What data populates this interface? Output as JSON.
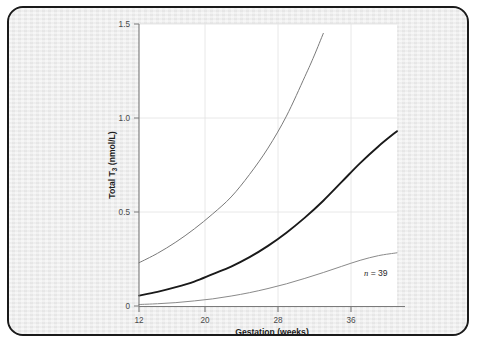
{
  "figure": {
    "frame_border_color": "#1a1a1a",
    "page_background": "#ececec",
    "plot_background": "#ffffff"
  },
  "chart_data": {
    "type": "line",
    "title": "",
    "subtitle": "",
    "xlabel": "Gestation (weeks)",
    "ylabel": "Total T",
    "ylabel_subscript": "3",
    "ylabel_units": " (nmol/L)",
    "ylabel_full": "Total T3 (nmol/L)",
    "xlim": [
      12,
      40
    ],
    "ylim": [
      0,
      1.5
    ],
    "xticks": [
      12,
      20,
      28,
      36
    ],
    "xtick_labels": [
      "12",
      "20",
      "28",
      "36"
    ],
    "yticks": [
      0,
      0.5,
      1.0,
      1.5
    ],
    "ytick_labels": [
      "0",
      "0.5",
      "1.0",
      "1.5"
    ],
    "grid": true,
    "grid_color": "#e2e2e2",
    "legend": "none",
    "annotations": [
      {
        "name": "sample-size",
        "italic_text": "n",
        "text": " = 39",
        "x": 36.0,
        "y": 0.175
      }
    ],
    "series": [
      {
        "name": "Upper reference limit (97.5th centile)",
        "color": "#7a7a7a",
        "width": 1.0,
        "x": [
          12,
          14,
          16,
          18,
          20,
          22,
          24,
          26,
          28,
          30,
          31,
          32
        ],
        "values": [
          0.23,
          0.28,
          0.34,
          0.41,
          0.49,
          0.58,
          0.7,
          0.84,
          1.01,
          1.22,
          1.33,
          1.45
        ]
      },
      {
        "name": "Median (50th centile)",
        "color": "#1a1a1a",
        "width": 1.9,
        "x": [
          12,
          14,
          16,
          18,
          20,
          22,
          24,
          26,
          28,
          30,
          32,
          34,
          36,
          38,
          40
        ],
        "values": [
          0.055,
          0.075,
          0.1,
          0.13,
          0.17,
          0.21,
          0.26,
          0.32,
          0.39,
          0.47,
          0.56,
          0.66,
          0.76,
          0.85,
          0.93
        ]
      },
      {
        "name": "Lower reference limit (2.5th centile)",
        "color": "#8a8a8a",
        "width": 1.0,
        "x": [
          12,
          14,
          16,
          18,
          20,
          22,
          24,
          26,
          28,
          30,
          32,
          34,
          36,
          38,
          40
        ],
        "values": [
          0.008,
          0.012,
          0.018,
          0.027,
          0.038,
          0.053,
          0.071,
          0.093,
          0.118,
          0.147,
          0.178,
          0.211,
          0.243,
          0.268,
          0.283
        ]
      }
    ]
  }
}
